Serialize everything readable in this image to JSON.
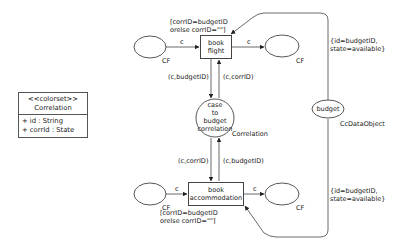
{
  "colorset": {
    "stereotype": "<<colorset>>",
    "name": "Correlation",
    "attributes": [
      "+ id : String",
      "+ corrId : State"
    ]
  },
  "transitions": {
    "book_flight": {
      "line1": "book",
      "line2": "flight",
      "guard1": "[corrID=budgetID",
      "guard2": "orelse corrID=\"\"]"
    },
    "book_accommodation": {
      "line1": "book",
      "line2": "accommodation",
      "guard1": "[corrID=budgetID",
      "guard2": "orelse corrID=\"\"]"
    }
  },
  "places": {
    "cf_top_in": {
      "type": "CF"
    },
    "cf_top_out": {
      "type": "CF"
    },
    "cf_bottom_in": {
      "type": "CF"
    },
    "cf_bottom_out": {
      "type": "CF"
    },
    "case_to_budget": {
      "line1": "case",
      "line2": "to",
      "line3": "budget",
      "line4": "correlation",
      "type": "Correlation"
    },
    "budget": {
      "label": "budget",
      "type": "CcDataObject"
    }
  },
  "arcs": {
    "c": "c",
    "c_budgetID": "(c,budgetID)",
    "c_corrID": "(c,corrID)",
    "budget_top1": "{id=budgetID,",
    "budget_top2": "state=available}",
    "budget_bottom1": "{id=budgetID,",
    "budget_bottom2": "state=available}"
  }
}
